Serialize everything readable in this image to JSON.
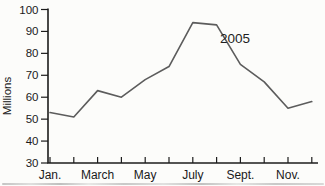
{
  "colors": {
    "background": "#fcfcfa",
    "axis": "#1c1c1c",
    "line": "#5c5c5c",
    "text": "#1a1a1a"
  },
  "chart_data": {
    "type": "line",
    "title": "",
    "n_points": 12,
    "series": [
      {
        "name": "2005",
        "values": [
          53,
          51,
          63,
          60,
          68,
          74,
          94,
          93,
          75,
          67,
          55,
          58
        ]
      }
    ],
    "xtick_labels": [
      "Jan.",
      "March",
      "May",
      "July",
      "Sept.",
      "Nov."
    ],
    "xtick_label_positions": [
      0,
      2,
      4,
      6,
      8,
      10
    ],
    "ylabel": "Millions",
    "ylim": [
      30,
      100
    ],
    "yticks": [
      100,
      90,
      80,
      70,
      60,
      50,
      40,
      30
    ],
    "annotation": {
      "text": "2005"
    },
    "grid": false,
    "legend": "none"
  }
}
